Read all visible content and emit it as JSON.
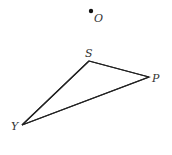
{
  "diagram": {
    "type": "geometry",
    "canvas": {
      "width": 172,
      "height": 155,
      "background": "#ffffff"
    },
    "stroke_color": "#222222",
    "label_color": "#333333",
    "points": [
      {
        "id": "O",
        "label": "O",
        "x": 91,
        "y": 11,
        "standalone": true
      },
      {
        "id": "S",
        "label": "S",
        "x": 89,
        "y": 61
      },
      {
        "id": "P",
        "label": "P",
        "x": 149,
        "y": 77
      },
      {
        "id": "Y",
        "label": "Y",
        "x": 22,
        "y": 125
      }
    ],
    "triangle": {
      "name": "triangle SPY",
      "vertices": [
        "S",
        "P",
        "Y"
      ],
      "segments": [
        [
          "S",
          "P"
        ],
        [
          "P",
          "Y"
        ],
        [
          "Y",
          "S"
        ]
      ]
    }
  }
}
